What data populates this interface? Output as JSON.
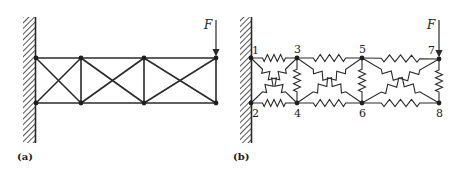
{
  "panels": [
    {
      "id": "a",
      "caption": "(a)",
      "force_label": "F",
      "description": "Cantilevered truss fixed to wall, three bays with X-bracing, load F at free top corner"
    },
    {
      "id": "b",
      "caption": "(b)",
      "force_label": "F",
      "node_labels": [
        "1",
        "2",
        "3",
        "4",
        "5",
        "6",
        "7",
        "8"
      ],
      "description": "Spring model of the truss with numbered nodes"
    }
  ],
  "colors": {
    "ink": "#2a2a2a",
    "background": "#ffffff"
  }
}
